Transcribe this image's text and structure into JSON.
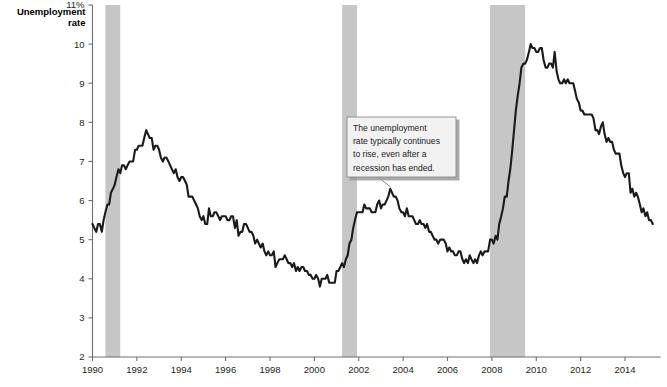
{
  "chart_data": {
    "type": "line",
    "title": "",
    "xlabel": "",
    "ylabel": "Unemployment rate",
    "ylabel_line1": "Unemployment",
    "ylabel_line2": "rate",
    "ylim": [
      2,
      11
    ],
    "xlim": [
      1990,
      2015.6
    ],
    "grid": false,
    "legend": null,
    "y_ticks": [
      2,
      3,
      4,
      5,
      6,
      7,
      8,
      9,
      10,
      11
    ],
    "y_tick_labels": [
      "2",
      "3",
      "4",
      "5",
      "6",
      "7",
      "8",
      "9",
      "10",
      "11%"
    ],
    "x_ticks": [
      1990,
      1992,
      1994,
      1996,
      1998,
      2000,
      2002,
      2004,
      2006,
      2008,
      2010,
      2012,
      2014
    ],
    "x_tick_labels": [
      "1990",
      "1992",
      "1994",
      "1996",
      "1998",
      "2000",
      "2002",
      "2004",
      "2006",
      "2008",
      "2010",
      "2012",
      "2014"
    ],
    "line_color": "#1a1a1a",
    "band_color": "#c6c6c6",
    "axis_color": "#6d6e71",
    "recession_bands": [
      {
        "label": "1990-91 recession",
        "start": 1990.58,
        "end": 1991.25
      },
      {
        "label": "2001 recession",
        "start": 2001.25,
        "end": 2001.92
      },
      {
        "label": "2007-09 recession",
        "start": 2007.92,
        "end": 2009.5
      }
    ],
    "series": [
      {
        "name": "Unemployment rate",
        "x": [
          1990.0,
          1990.08,
          1990.17,
          1990.25,
          1990.33,
          1990.42,
          1990.5,
          1990.58,
          1990.67,
          1990.75,
          1990.83,
          1990.92,
          1991.0,
          1991.08,
          1991.17,
          1991.25,
          1991.33,
          1991.42,
          1991.5,
          1991.58,
          1991.67,
          1991.75,
          1991.83,
          1991.92,
          1992.0,
          1992.08,
          1992.17,
          1992.25,
          1992.33,
          1992.42,
          1992.5,
          1992.58,
          1992.67,
          1992.75,
          1992.83,
          1992.92,
          1993.0,
          1993.08,
          1993.17,
          1993.25,
          1993.33,
          1993.42,
          1993.5,
          1993.58,
          1993.67,
          1993.75,
          1993.83,
          1993.92,
          1994.0,
          1994.08,
          1994.17,
          1994.25,
          1994.33,
          1994.42,
          1994.5,
          1994.58,
          1994.67,
          1994.75,
          1994.83,
          1994.92,
          1995.0,
          1995.08,
          1995.17,
          1995.25,
          1995.33,
          1995.42,
          1995.5,
          1995.58,
          1995.67,
          1995.75,
          1995.83,
          1995.92,
          1996.0,
          1996.08,
          1996.17,
          1996.25,
          1996.33,
          1996.42,
          1996.5,
          1996.58,
          1996.67,
          1996.75,
          1996.83,
          1996.92,
          1997.0,
          1997.08,
          1997.17,
          1997.25,
          1997.33,
          1997.42,
          1997.5,
          1997.58,
          1997.67,
          1997.75,
          1997.83,
          1997.92,
          1998.0,
          1998.08,
          1998.17,
          1998.25,
          1998.33,
          1998.42,
          1998.5,
          1998.58,
          1998.67,
          1998.75,
          1998.83,
          1998.92,
          1999.0,
          1999.08,
          1999.17,
          1999.25,
          1999.33,
          1999.42,
          1999.5,
          1999.58,
          1999.67,
          1999.75,
          1999.83,
          1999.92,
          2000.0,
          2000.08,
          2000.17,
          2000.25,
          2000.33,
          2000.42,
          2000.5,
          2000.58,
          2000.67,
          2000.75,
          2000.83,
          2000.92,
          2001.0,
          2001.08,
          2001.17,
          2001.25,
          2001.33,
          2001.42,
          2001.5,
          2001.58,
          2001.67,
          2001.75,
          2001.83,
          2001.92,
          2002.0,
          2002.08,
          2002.17,
          2002.25,
          2002.33,
          2002.42,
          2002.5,
          2002.58,
          2002.67,
          2002.75,
          2002.83,
          2002.92,
          2003.0,
          2003.08,
          2003.17,
          2003.25,
          2003.33,
          2003.42,
          2003.5,
          2003.58,
          2003.67,
          2003.75,
          2003.83,
          2003.92,
          2004.0,
          2004.08,
          2004.17,
          2004.25,
          2004.33,
          2004.42,
          2004.5,
          2004.58,
          2004.67,
          2004.75,
          2004.83,
          2004.92,
          2005.0,
          2005.08,
          2005.17,
          2005.25,
          2005.33,
          2005.42,
          2005.5,
          2005.58,
          2005.67,
          2005.75,
          2005.83,
          2005.92,
          2006.0,
          2006.08,
          2006.17,
          2006.25,
          2006.33,
          2006.42,
          2006.5,
          2006.58,
          2006.67,
          2006.75,
          2006.83,
          2006.92,
          2007.0,
          2007.08,
          2007.17,
          2007.25,
          2007.33,
          2007.42,
          2007.5,
          2007.58,
          2007.67,
          2007.75,
          2007.83,
          2007.92,
          2008.0,
          2008.08,
          2008.17,
          2008.25,
          2008.33,
          2008.42,
          2008.5,
          2008.58,
          2008.67,
          2008.75,
          2008.83,
          2008.92,
          2009.0,
          2009.08,
          2009.17,
          2009.25,
          2009.33,
          2009.42,
          2009.5,
          2009.58,
          2009.67,
          2009.75,
          2009.83,
          2009.92,
          2010.0,
          2010.08,
          2010.17,
          2010.25,
          2010.33,
          2010.42,
          2010.5,
          2010.58,
          2010.67,
          2010.75,
          2010.83,
          2010.92,
          2011.0,
          2011.08,
          2011.17,
          2011.25,
          2011.33,
          2011.42,
          2011.5,
          2011.58,
          2011.67,
          2011.75,
          2011.83,
          2011.92,
          2012.0,
          2012.08,
          2012.17,
          2012.25,
          2012.33,
          2012.42,
          2012.5,
          2012.58,
          2012.67,
          2012.75,
          2012.83,
          2012.92,
          2013.0,
          2013.08,
          2013.17,
          2013.25,
          2013.33,
          2013.42,
          2013.5,
          2013.58,
          2013.67,
          2013.75,
          2013.83,
          2013.92,
          2014.0,
          2014.08,
          2014.17,
          2014.25,
          2014.33,
          2014.42,
          2014.5,
          2014.58,
          2014.67,
          2014.75,
          2014.83,
          2014.92,
          2015.0,
          2015.08,
          2015.17,
          2015.25
        ],
        "values": [
          5.4,
          5.3,
          5.2,
          5.4,
          5.4,
          5.2,
          5.5,
          5.7,
          5.9,
          5.9,
          6.2,
          6.3,
          6.4,
          6.6,
          6.8,
          6.7,
          6.9,
          6.9,
          6.8,
          6.9,
          7.0,
          7.0,
          7.0,
          7.3,
          7.3,
          7.4,
          7.4,
          7.4,
          7.6,
          7.8,
          7.7,
          7.6,
          7.6,
          7.3,
          7.4,
          7.4,
          7.3,
          7.1,
          7.0,
          7.1,
          7.1,
          7.0,
          6.9,
          6.8,
          6.7,
          6.8,
          6.6,
          6.5,
          6.6,
          6.6,
          6.5,
          6.4,
          6.1,
          6.1,
          6.1,
          6.0,
          5.9,
          5.8,
          5.6,
          5.5,
          5.6,
          5.4,
          5.4,
          5.8,
          5.6,
          5.6,
          5.7,
          5.7,
          5.6,
          5.5,
          5.6,
          5.6,
          5.6,
          5.5,
          5.5,
          5.6,
          5.6,
          5.3,
          5.5,
          5.1,
          5.2,
          5.2,
          5.4,
          5.4,
          5.3,
          5.2,
          5.2,
          5.1,
          4.9,
          5.0,
          4.9,
          4.8,
          4.9,
          4.7,
          4.6,
          4.7,
          4.6,
          4.6,
          4.7,
          4.3,
          4.4,
          4.5,
          4.5,
          4.5,
          4.6,
          4.5,
          4.4,
          4.4,
          4.3,
          4.4,
          4.2,
          4.3,
          4.2,
          4.3,
          4.3,
          4.2,
          4.2,
          4.1,
          4.1,
          4.0,
          4.0,
          4.1,
          4.0,
          3.8,
          4.0,
          4.0,
          4.0,
          4.1,
          3.9,
          3.9,
          3.9,
          3.9,
          4.2,
          4.2,
          4.3,
          4.4,
          4.3,
          4.5,
          4.6,
          4.9,
          5.0,
          5.3,
          5.5,
          5.7,
          5.7,
          5.7,
          5.7,
          5.9,
          5.8,
          5.8,
          5.8,
          5.7,
          5.7,
          5.7,
          5.9,
          6.0,
          5.8,
          5.9,
          5.9,
          6.0,
          6.1,
          6.3,
          6.2,
          6.1,
          6.1,
          6.0,
          5.8,
          5.7,
          5.7,
          5.6,
          5.8,
          5.6,
          5.6,
          5.6,
          5.5,
          5.4,
          5.4,
          5.5,
          5.4,
          5.4,
          5.3,
          5.4,
          5.2,
          5.2,
          5.1,
          5.0,
          5.0,
          4.9,
          5.0,
          5.0,
          5.0,
          4.9,
          4.7,
          4.8,
          4.7,
          4.7,
          4.6,
          4.6,
          4.7,
          4.7,
          4.5,
          4.4,
          4.5,
          4.4,
          4.6,
          4.5,
          4.4,
          4.5,
          4.4,
          4.6,
          4.7,
          4.6,
          4.7,
          4.7,
          4.7,
          5.0,
          5.0,
          4.9,
          5.1,
          5.0,
          5.4,
          5.6,
          5.8,
          6.1,
          6.1,
          6.5,
          6.8,
          7.3,
          7.8,
          8.3,
          8.7,
          9.0,
          9.4,
          9.5,
          9.5,
          9.6,
          9.8,
          10.0,
          9.9,
          9.9,
          9.8,
          9.8,
          9.9,
          9.9,
          9.6,
          9.4,
          9.4,
          9.5,
          9.5,
          9.4,
          9.8,
          9.3,
          9.1,
          9.0,
          9.0,
          9.1,
          9.0,
          9.1,
          9.0,
          9.0,
          9.0,
          8.8,
          8.6,
          8.5,
          8.3,
          8.3,
          8.2,
          8.2,
          8.2,
          8.2,
          8.2,
          8.1,
          7.8,
          7.8,
          7.7,
          7.9,
          8.0,
          7.7,
          7.5,
          7.6,
          7.5,
          7.5,
          7.3,
          7.2,
          7.2,
          7.2,
          6.9,
          6.7,
          6.6,
          6.7,
          6.7,
          6.2,
          6.3,
          6.1,
          6.2,
          6.1,
          5.9,
          5.7,
          5.8,
          5.6,
          5.7,
          5.5,
          5.5,
          5.4
        ]
      }
    ],
    "annotations": [
      {
        "name": "recession-callout",
        "lines": [
          "The unemployment",
          "rate typically continues",
          "to rise, even after a",
          "recession has ended."
        ],
        "target_x": 2003.42,
        "target_y": 6.3
      }
    ]
  }
}
